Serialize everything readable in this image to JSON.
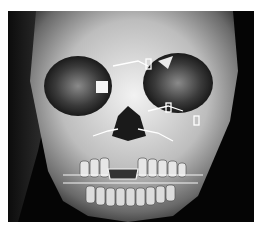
{
  "image": {
    "description": "3D CT volume rendering of a skull (frontal view) with facial fracture fixation plates and intermaxillary wiring",
    "background_color": "#000000",
    "border_color": "#ffffff",
    "bone_tone": "#d8d8d8"
  }
}
